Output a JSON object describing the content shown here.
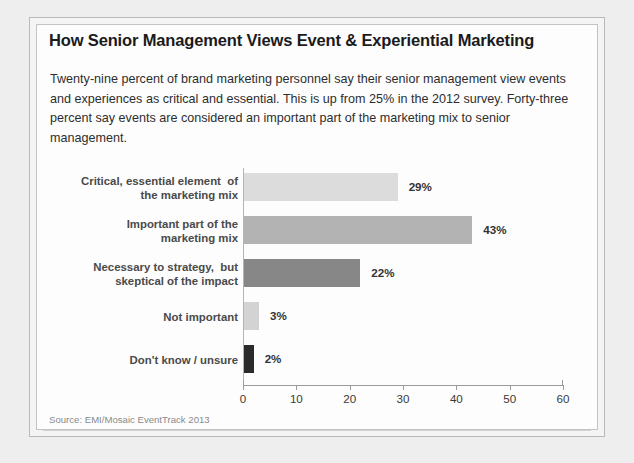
{
  "card": {
    "title": "How Senior Management Views Event & Experiential Marketing",
    "intro": "Twenty-nine percent of brand marketing personnel say their senior management view events and experiences as critical and essential. This is up from 25% in the 2012 survey. Forty-three percent say events are considered an important part of the marketing mix to senior management.",
    "source": "Source: EMI/Mosaic EventTrack 2013"
  },
  "chart_data": {
    "type": "bar",
    "orientation": "horizontal",
    "title": "How Senior Management Views Event & Experiential Marketing",
    "xlabel": "",
    "ylabel": "",
    "xlim": [
      0,
      60
    ],
    "xticks": [
      0,
      10,
      20,
      30,
      40,
      50,
      60
    ],
    "xtick_labels": [
      "0",
      "10",
      "20",
      "30",
      "40",
      "50",
      "60"
    ],
    "grid": false,
    "legend": false,
    "categories": [
      "Critical, essential element  of\nthe marketing mix",
      "Important part of the\nmarketing mix",
      "Necessary to strategy,  but\nskeptical of the impact",
      "Not important",
      "Don't know / unsure"
    ],
    "values": [
      29,
      43,
      22,
      3,
      2
    ],
    "data_labels": [
      "29%",
      "43%",
      "22%",
      "3%",
      "2%"
    ],
    "bar_colors": [
      "#dcdcdc",
      "#b3b3b3",
      "#878787",
      "#d3d3d3",
      "#2b2b2b"
    ]
  },
  "colors": {
    "page_background": "#eeeeee",
    "card_background": "#fdfdfd",
    "frame_border": "#b9b9b9",
    "title_text": "#1b1b1b",
    "body_text": "#2d2d2d",
    "category_text": "#4a4a4a",
    "axis": "#9a9a9a",
    "source_text": "#8a8a8a"
  }
}
